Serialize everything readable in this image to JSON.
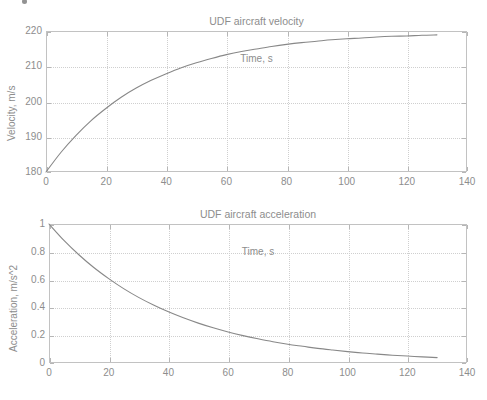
{
  "page": {
    "background": "#ffffff",
    "cropped_header_text": "",
    "footer_ghost_text": ""
  },
  "style": {
    "axis_color": "#c2c2c2",
    "grid_color": "#cfcfcf",
    "text_color": "#8d8d8d",
    "curve_color": "#888888"
  },
  "chart_data": [
    {
      "type": "line",
      "title": "UDF aircraft velocity",
      "xlabel": "Time, s",
      "ylabel": "Velocity, m/s",
      "xlim": [
        0,
        140
      ],
      "ylim": [
        180,
        220
      ],
      "xticks": [
        0,
        20,
        40,
        60,
        80,
        100,
        120,
        140
      ],
      "xticklabels": [
        "0",
        "20",
        "40",
        "60",
        "80",
        "100",
        "120",
        "140"
      ],
      "yticks": [
        180,
        190,
        200,
        210,
        220
      ],
      "yticklabels": [
        "180",
        "190",
        "200",
        "210",
        "220"
      ],
      "grid": true,
      "legend": null,
      "series": [
        {
          "name": "velocity",
          "color": "#888888",
          "x": [
            0,
            5,
            10,
            15,
            20,
            25,
            30,
            35,
            40,
            45,
            50,
            55,
            60,
            65,
            70,
            75,
            80,
            85,
            90,
            95,
            100,
            105,
            110,
            115,
            120,
            125,
            130
          ],
          "values": [
            180.0,
            185.6,
            190.4,
            194.6,
            198.1,
            201.2,
            203.8,
            206.0,
            207.9,
            209.6,
            211.0,
            212.2,
            213.3,
            214.2,
            214.9,
            215.6,
            216.2,
            216.7,
            217.1,
            217.5,
            217.8,
            218.0,
            218.3,
            218.5,
            218.6,
            218.8,
            218.9
          ]
        }
      ]
    },
    {
      "type": "line",
      "title": "UDF aircraft acceleration",
      "xlabel": "Time, s",
      "ylabel": "Acceleration, m/s^2",
      "xlim": [
        0,
        140
      ],
      "ylim": [
        0,
        1
      ],
      "xticks": [
        0,
        20,
        40,
        60,
        80,
        100,
        120,
        140
      ],
      "xticklabels": [
        "0",
        "20",
        "40",
        "60",
        "80",
        "100",
        "120",
        "140"
      ],
      "yticks": [
        0,
        0.2,
        0.4,
        0.6,
        0.8,
        1
      ],
      "yticklabels": [
        "0",
        "0.2",
        "0.4",
        "0.6",
        "0.8",
        "1"
      ],
      "grid": true,
      "legend": null,
      "series": [
        {
          "name": "acceleration",
          "color": "#888888",
          "x": [
            0,
            5,
            10,
            15,
            20,
            25,
            30,
            35,
            40,
            45,
            50,
            55,
            60,
            65,
            70,
            75,
            80,
            85,
            90,
            95,
            100,
            105,
            110,
            115,
            120,
            125,
            130
          ],
          "values": [
            1.0,
            0.882,
            0.779,
            0.687,
            0.607,
            0.535,
            0.472,
            0.417,
            0.368,
            0.325,
            0.287,
            0.253,
            0.223,
            0.197,
            0.174,
            0.153,
            0.135,
            0.12,
            0.105,
            0.093,
            0.082,
            0.072,
            0.064,
            0.056,
            0.05,
            0.044,
            0.039
          ]
        }
      ]
    }
  ]
}
